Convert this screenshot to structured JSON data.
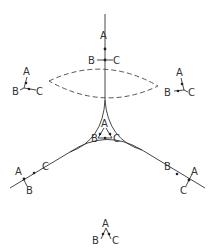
{
  "diagram": {
    "type": "phase-diagram-sketch",
    "labels": {
      "top": {
        "a": "A",
        "b": "B",
        "c": "C"
      },
      "upper_left": {
        "a": "A",
        "b": "B",
        "c": "C"
      },
      "upper_right": {
        "a": "A",
        "b": "B",
        "c": "C"
      },
      "center": {
        "a": "A",
        "b": "B",
        "c": "C"
      },
      "lower_left": {
        "a": "A",
        "b": "B",
        "c": "C"
      },
      "lower_right": {
        "a": "A",
        "b": "B",
        "c": "C"
      },
      "bottom": {
        "a": "A",
        "b": "B",
        "c": "C"
      }
    },
    "elements": {
      "central_region": "curved-triangle (three concave arcs)",
      "dashed_region": "lens-shaped dashed ellipse above center",
      "branch_lines": [
        "top vertical",
        "lower-left diagonal",
        "lower-right diagonal"
      ]
    },
    "colors": {
      "line": "#333333",
      "background": "#ffffff"
    }
  }
}
